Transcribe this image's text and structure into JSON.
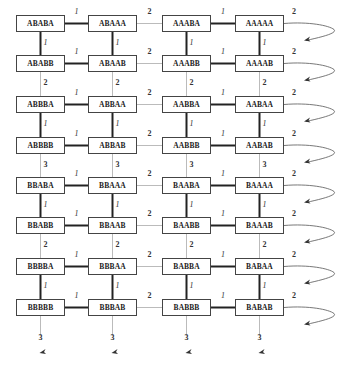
{
  "diagram": {
    "columns_x": [
      16,
      88,
      162,
      235
    ],
    "rows_y": [
      15,
      55,
      96,
      137,
      177,
      217,
      258,
      299
    ],
    "nodes": [
      [
        "ABABA",
        "ABAAA",
        "AAABA",
        "AAAAA"
      ],
      [
        "ABABB",
        "ABAAB",
        "AAABB",
        "AAAAB"
      ],
      [
        "ABBBA",
        "ABBAA",
        "AABBA",
        "AABAA"
      ],
      [
        "ABBBB",
        "ABBAB",
        "AABBB",
        "AABAB"
      ],
      [
        "BBABA",
        "BBAAA",
        "BAABA",
        "BAAAA"
      ],
      [
        "BBABB",
        "BBAAB",
        "BAABB",
        "BAAAB"
      ],
      [
        "BBBBA",
        "BBBAA",
        "BABBA",
        "BABAA"
      ],
      [
        "BBBBB",
        "BBBAB",
        "BABBB",
        "BABAB"
      ]
    ],
    "horizontal_edge_labels": [
      "1",
      "2",
      "1"
    ],
    "wrap_edge_label": "2",
    "vertical_edge_labels": [
      "1",
      "2",
      "1",
      "3",
      "1",
      "2",
      "1"
    ],
    "bottom_wrap_label": "3",
    "colors": {
      "strong_edge": "#222222",
      "weak_edge": "#aaaaaa",
      "box_border": "#444444"
    }
  }
}
